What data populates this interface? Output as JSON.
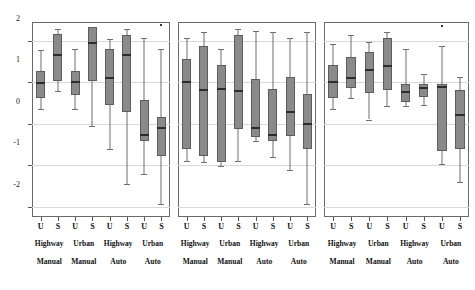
{
  "figure": {
    "title": "",
    "panel_count": 3,
    "box_fill_color": "#8a8a8a",
    "median_color": "#2c2c2c",
    "whisker_color": "#6f6f6f",
    "frame_color": "#6a6a6a",
    "grid_color": "#d9d9d9"
  },
  "axis": {
    "y_ticks": [
      2,
      1,
      0,
      -1,
      -2
    ],
    "y_tick_labels": [
      "2",
      "1",
      "0",
      "-1",
      "-2"
    ],
    "ylim": [
      -2.25,
      2.45
    ],
    "ylabel": "",
    "xlabel": "",
    "grid": true,
    "grid_values": [
      2,
      1,
      0,
      -1,
      -2
    ]
  },
  "x_categories": {
    "level1": [
      "U",
      "S",
      "U",
      "S",
      "U",
      "S",
      "U",
      "S"
    ],
    "level2": [
      "Highway",
      "Urban",
      "Highway",
      "Urban"
    ],
    "level3": [
      "Manual",
      "Manual",
      "Auto",
      "Auto"
    ]
  },
  "chart_data": {
    "type": "box",
    "title": "",
    "xlabel": "",
    "ylabel": "",
    "ylim": [
      -2.25,
      2.45
    ],
    "grid": true,
    "categories": [
      "U",
      "S",
      "U",
      "S",
      "U",
      "S",
      "U",
      "S"
    ],
    "group_labels": [
      "Highway Manual",
      "Highway Manual",
      "Urban Manual",
      "Urban Manual",
      "Highway Auto",
      "Highway Auto",
      "Urban Auto",
      "Urban Auto"
    ],
    "panels": [
      {
        "name": "panel-1",
        "boxes": [
          {
            "label": "U",
            "group": "Highway Manual",
            "whisker_low": 0.35,
            "q1": 0.62,
            "median": 1.0,
            "q3": 1.28,
            "whisker_high": 1.77
          },
          {
            "label": "S",
            "group": "Highway Manual",
            "whisker_low": 0.78,
            "q1": 1.03,
            "median": 1.68,
            "q3": 2.15,
            "whisker_high": 2.28
          },
          {
            "label": "U",
            "group": "Urban Manual",
            "whisker_low": 0.36,
            "q1": 0.7,
            "median": 1.03,
            "q3": 1.27,
            "whisker_high": 1.8
          },
          {
            "label": "S",
            "group": "Urban Manual",
            "whisker_low": -0.06,
            "q1": 1.03,
            "median": 1.98,
            "q3": 2.33,
            "whisker_high": 2.33
          },
          {
            "label": "U",
            "group": "Highway Auto",
            "whisker_low": -0.61,
            "q1": 0.45,
            "median": 1.12,
            "q3": 1.8,
            "whisker_high": 2.05
          },
          {
            "label": "S",
            "group": "Highway Auto",
            "whisker_low": -1.46,
            "q1": 0.28,
            "median": 1.68,
            "q3": 2.13,
            "whisker_high": 2.28
          },
          {
            "label": "U",
            "group": "Urban Auto",
            "whisker_low": -1.21,
            "q1": -0.43,
            "median": -0.26,
            "q3": 0.57,
            "whisker_high": 2.06
          },
          {
            "label": "S",
            "group": "Urban Auto",
            "whisker_low": -1.93,
            "q1": -0.77,
            "median": -0.07,
            "q3": 0.16,
            "whisker_high": 1.8
          }
        ],
        "outliers": [
          {
            "x_index": 7,
            "value": 2.4
          }
        ]
      },
      {
        "name": "panel-2",
        "boxes": [
          {
            "label": "U",
            "group": "Highway Manual",
            "whisker_low": -0.9,
            "q1": -0.62,
            "median": 1.03,
            "q3": 1.55,
            "whisker_high": 2.07
          },
          {
            "label": "S",
            "group": "Highway Manual",
            "whisker_low": -0.92,
            "q1": -0.78,
            "median": 0.84,
            "q3": 1.88,
            "whisker_high": 2.2
          },
          {
            "label": "U",
            "group": "Urban Manual",
            "whisker_low": -1.03,
            "q1": -0.92,
            "median": 0.86,
            "q3": 1.42,
            "whisker_high": 1.8
          },
          {
            "label": "S",
            "group": "Urban Manual",
            "whisker_low": -0.9,
            "q1": -0.12,
            "median": 0.8,
            "q3": 2.13,
            "whisker_high": 2.27
          },
          {
            "label": "U",
            "group": "Highway Auto",
            "whisker_low": -0.41,
            "q1": -0.33,
            "median": -0.08,
            "q3": 1.07,
            "whisker_high": 2.23
          },
          {
            "label": "S",
            "group": "Highway Auto",
            "whisker_low": -0.8,
            "q1": -0.43,
            "median": -0.26,
            "q3": 0.83,
            "whisker_high": 2.2
          },
          {
            "label": "U",
            "group": "Urban Auto",
            "whisker_low": -1.12,
            "q1": -0.3,
            "median": 0.31,
            "q3": 1.12,
            "whisker_high": 2.07
          },
          {
            "label": "S",
            "group": "Urban Auto",
            "whisker_low": -1.93,
            "q1": -0.62,
            "median": 0.02,
            "q3": 0.72,
            "whisker_high": 2.2
          }
        ],
        "outliers": []
      },
      {
        "name": "panel-3",
        "boxes": [
          {
            "label": "U",
            "group": "Highway Manual",
            "whisker_low": 0.35,
            "q1": 0.62,
            "median": 1.02,
            "q3": 1.42,
            "whisker_high": 1.92
          },
          {
            "label": "S",
            "group": "Highway Manual",
            "whisker_low": 0.62,
            "q1": 0.85,
            "median": 1.12,
            "q3": 1.6,
            "whisker_high": 2.13
          },
          {
            "label": "U",
            "group": "Urban Manual",
            "whisker_low": 0.1,
            "q1": 0.74,
            "median": 1.32,
            "q3": 1.72,
            "whisker_high": 1.98
          },
          {
            "label": "S",
            "group": "Urban Manual",
            "whisker_low": 0.42,
            "q1": 0.8,
            "median": 1.42,
            "q3": 2.07,
            "whisker_high": 2.2
          },
          {
            "label": "U",
            "group": "Highway Auto",
            "whisker_low": 0.42,
            "q1": 0.52,
            "median": 0.78,
            "q3": 0.95,
            "whisker_high": 1.8
          },
          {
            "label": "S",
            "group": "Highway Auto",
            "whisker_low": 0.45,
            "q1": 0.64,
            "median": 0.88,
            "q3": 0.96,
            "whisker_high": 1.2
          },
          {
            "label": "U",
            "group": "Urban Auto",
            "whisker_low": -0.97,
            "q1": -0.66,
            "median": 0.9,
            "q3": 0.95,
            "whisker_high": 1.88
          },
          {
            "label": "S",
            "group": "Urban Auto",
            "whisker_low": -1.4,
            "q1": -0.61,
            "median": 0.24,
            "q3": 0.82,
            "whisker_high": 1.12
          }
        ],
        "outliers": [
          {
            "x_index": 6,
            "value": 2.38
          }
        ]
      }
    ]
  }
}
